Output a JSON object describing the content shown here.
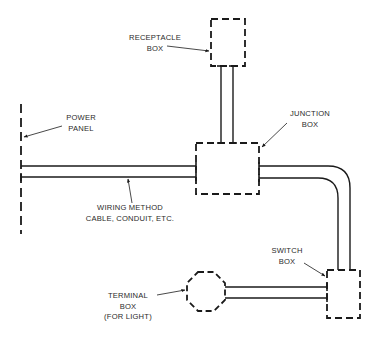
{
  "diagram": {
    "type": "electrical-wiring-system",
    "colors": {
      "line": "#1a1a1a",
      "text": "#2a2a2a",
      "background": "#ffffff"
    },
    "components": {
      "receptacle_box": {
        "lines": [
          "RECEPTACLE",
          "BOX"
        ],
        "shape": "dashed-rectangle"
      },
      "junction_box": {
        "lines": [
          "JUNCTION",
          "BOX"
        ],
        "shape": "dashed-rectangle"
      },
      "power_panel": {
        "lines": [
          "POWER",
          "PANEL"
        ],
        "shape": "dashed-vertical-line"
      },
      "wiring_method": {
        "lines": [
          "WIRING METHOD",
          "CABLE, CONDUIT, ETC."
        ],
        "shape": "parallel-lines"
      },
      "switch_box": {
        "lines": [
          "SWITCH",
          "BOX"
        ],
        "shape": "dashed-rectangle"
      },
      "terminal_box": {
        "lines": [
          "TERMINAL",
          "BOX",
          "(FOR LIGHT)"
        ],
        "shape": "dashed-octagon"
      }
    },
    "connections": [
      {
        "from": "power_panel",
        "to": "junction_box"
      },
      {
        "from": "junction_box",
        "to": "receptacle_box"
      },
      {
        "from": "junction_box",
        "to": "switch_box"
      },
      {
        "from": "switch_box",
        "to": "terminal_box"
      }
    ]
  }
}
